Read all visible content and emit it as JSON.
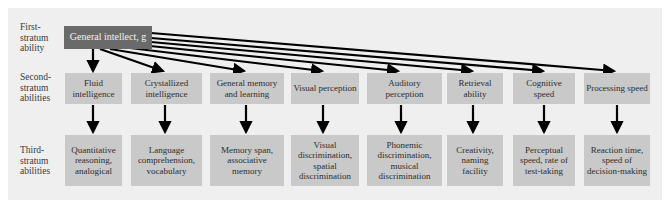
{
  "figure": {
    "strata": [
      {
        "label": "First-\nstratum\nability"
      },
      {
        "label": "Second-\nstratum\nabilities"
      },
      {
        "label": "Third-\nstratum\nabilities"
      }
    ],
    "first_stratum": {
      "label": "General intellect, g"
    },
    "second_stratum": [
      {
        "label": "Fluid intelligence"
      },
      {
        "label": "Crystallized intelligence"
      },
      {
        "label": "General memory and learning"
      },
      {
        "label": "Visual perception"
      },
      {
        "label": "Auditory perception"
      },
      {
        "label": "Retrieval ability"
      },
      {
        "label": "Cognitive speed"
      },
      {
        "label": "Processing speed"
      }
    ],
    "third_stratum": [
      {
        "label": "Quantitative reasoning, analogical"
      },
      {
        "label": "Language comprehension, vocabulary"
      },
      {
        "label": "Memory span, associative memory"
      },
      {
        "label": "Visual discrimination, spatial discrimination"
      },
      {
        "label": "Phonemic discrimination, musical discrimination"
      },
      {
        "label": "Creativity, naming facility"
      },
      {
        "label": "Perceptual speed, rate of test-taking"
      },
      {
        "label": "Reaction time, speed of decision-making"
      }
    ],
    "colors": {
      "panel": "#efefef",
      "box": "#c9c9c9",
      "top_box": "#6a6a6a",
      "arrow": "#000000"
    }
  }
}
